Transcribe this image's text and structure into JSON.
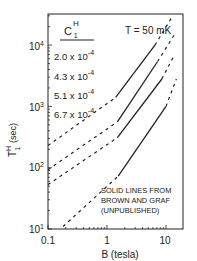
{
  "chart_data": {
    "type": "line",
    "title": "",
    "annotation_temperature": "T = 50 mK",
    "annotation_source": [
      "SOLID LINES FROM",
      "BROWN AND GRAF",
      "(UNPUBLISHED)"
    ],
    "xlabel": "B   (tesla)",
    "ylabel_main": "T",
    "ylabel_sup": "H",
    "ylabel_sub": "1",
    "ylabel_unit": "(sec)",
    "xscale": "log",
    "yscale": "log",
    "xlim": [
      0.1,
      20
    ],
    "ylim": [
      10,
      30000
    ],
    "x_ticks": [
      {
        "label": "0.1",
        "value": 0.1
      },
      {
        "label": "1",
        "value": 1
      },
      {
        "label": "10",
        "value": 10
      }
    ],
    "y_ticks": [
      {
        "base": "10",
        "exp": "1",
        "value": 10
      },
      {
        "base": "10",
        "exp": "2",
        "value": 100
      },
      {
        "base": "10",
        "exp": "3",
        "value": 1000
      },
      {
        "base": "10",
        "exp": "4",
        "value": 10000
      }
    ],
    "legend": {
      "title_main": "C",
      "title_sup": "H",
      "title_sub": "1",
      "entries": [
        "2.0 x 10",
        "4.3 x 10",
        "5.1 x 10",
        "6.7 x 10"
      ],
      "entry_exp": "-4"
    },
    "series": [
      {
        "name": "2.0 x 10^-4",
        "dashed": [
          [
            0.1,
            230
          ],
          [
            1.4,
            1400
          ]
        ],
        "solid": [
          [
            1.4,
            1400
          ],
          [
            6.5,
            10000
          ]
        ],
        "dashed_end": [
          [
            6.5,
            10000
          ],
          [
            13,
            30000
          ]
        ]
      },
      {
        "name": "4.3 x 10^-4",
        "dashed": [
          [
            0.1,
            93
          ],
          [
            1.5,
            560
          ]
        ],
        "solid": [
          [
            1.5,
            560
          ],
          [
            7.2,
            5400
          ]
        ],
        "dashed_end": [
          [
            7.2,
            5400
          ],
          [
            14,
            15000
          ]
        ]
      },
      {
        "name": "5.1 x 10^-4",
        "dashed": [
          [
            0.1,
            53
          ],
          [
            1.5,
            310
          ]
        ],
        "solid": [
          [
            1.5,
            310
          ],
          [
            8.5,
            2800
          ]
        ],
        "dashed_end": [
          [
            8.5,
            2800
          ],
          [
            14,
            7000
          ]
        ]
      },
      {
        "name": "6.7 x 10^-4",
        "dashed": [
          [
            0.18,
            11
          ],
          [
            1.55,
            73
          ]
        ],
        "solid": [
          [
            1.55,
            73
          ],
          [
            10,
            1000
          ]
        ],
        "dashed_end": [
          [
            10,
            1000
          ],
          [
            15,
            2800
          ]
        ]
      }
    ]
  }
}
